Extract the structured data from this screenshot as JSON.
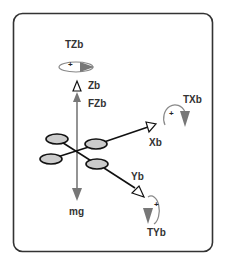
{
  "diagram": {
    "colors": {
      "frame_border": "#333333",
      "axis_black": "#111111",
      "force_gray": "#777777",
      "propeller_fill": "#cccccc",
      "torque_ring": "#888888"
    },
    "labels": {
      "tzb": "TZb",
      "zb": "Zb",
      "fzb": "FZb",
      "txb": "TXb",
      "xb": "Xb",
      "yb": "Yb",
      "tyb": "TYb",
      "mg": "mg",
      "plus": "+"
    },
    "nodes": [
      {
        "id": "body-center",
        "label": "quadrotor"
      },
      {
        "id": "zb-axis",
        "label": "Zb"
      },
      {
        "id": "xb-axis",
        "label": "Xb"
      },
      {
        "id": "yb-axis",
        "label": "Yb"
      },
      {
        "id": "thrust",
        "label": "FZb"
      },
      {
        "id": "gravity",
        "label": "mg"
      },
      {
        "id": "torque-z",
        "label": "TZb"
      },
      {
        "id": "torque-x",
        "label": "TXb"
      },
      {
        "id": "torque-y",
        "label": "TYb"
      }
    ],
    "edges": [
      {
        "from": "body-center",
        "to": "zb-axis"
      },
      {
        "from": "body-center",
        "to": "xb-axis"
      },
      {
        "from": "body-center",
        "to": "yb-axis"
      },
      {
        "from": "body-center",
        "to": "thrust"
      },
      {
        "from": "body-center",
        "to": "gravity"
      }
    ]
  }
}
